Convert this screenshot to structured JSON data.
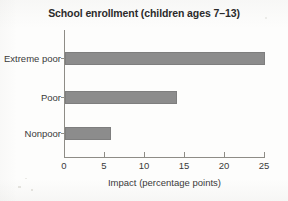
{
  "chart_data": {
    "type": "bar",
    "orientation": "horizontal",
    "title": "School enrollment (children ages 7–13)",
    "xlabel": "Impact (percentage points)",
    "ylabel": "",
    "categories": [
      "Extreme poor",
      "Poor",
      "Nonpoor"
    ],
    "values": [
      25.0,
      14.0,
      5.8
    ],
    "xlim": [
      0,
      25
    ],
    "xticks": [
      0,
      5,
      10,
      15,
      20,
      25
    ],
    "xtick_labels": [
      "0",
      "5",
      "10",
      "15",
      "20",
      "25"
    ],
    "grid": false,
    "legend": null,
    "bar_color": "#8c8c8c",
    "bar_edge_color": "#7e7e7e",
    "axis_color": "#8e8c86",
    "text_color": "#3a3a3a",
    "title_color": "#2b2b2b",
    "background_color": "#fdfdfc"
  }
}
